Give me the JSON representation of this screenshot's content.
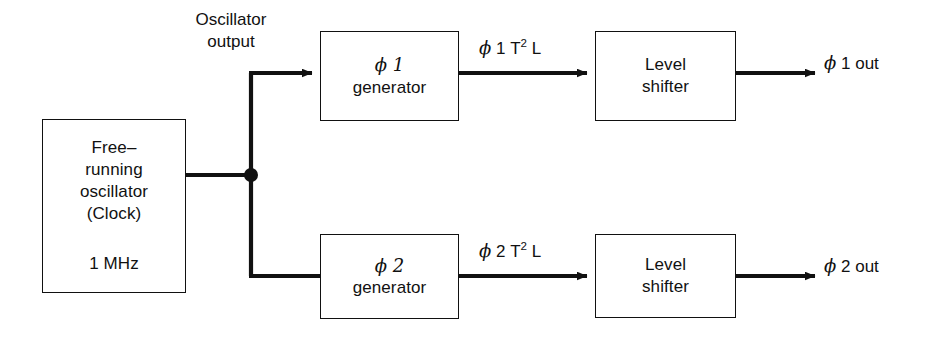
{
  "diagram": {
    "background_color": "#ffffff",
    "ink_color": "#111111",
    "blocks": {
      "oscillator": {
        "main_label": "Free–\nrunning\noscillator\n(Clock)",
        "frequency_label": "1 MHz"
      },
      "phi1_generator": {
        "line1": "ϕ 1",
        "line2": "generator"
      },
      "phi2_generator": {
        "line1": "ϕ 2",
        "line2": "generator"
      },
      "level_shifter_1": {
        "line1": "Level",
        "line2": "shifter"
      },
      "level_shifter_2": {
        "line1": "Level",
        "line2": "shifter"
      }
    },
    "labels": {
      "oscillator_output": "Oscillator\noutput",
      "phi1_t2l": "ϕ 1 T² L",
      "phi2_t2l": "ϕ 2 T² L",
      "phi1_out": "ϕ 1 out",
      "phi2_out": "ϕ 2 out"
    },
    "signal_flow": [
      "oscillator → junction",
      "junction → phi1 generator",
      "junction → phi2 generator",
      "phi1 generator → level shifter 1 → ϕ 1 out",
      "phi2 generator → level shifter 2 → ϕ 2 out"
    ]
  }
}
